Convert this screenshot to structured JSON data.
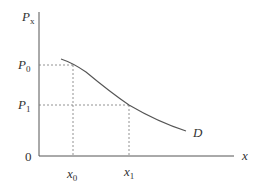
{
  "diagram": {
    "type": "demand-curve",
    "y_axis": {
      "label": "P",
      "label_sub": "x"
    },
    "x_axis": {
      "label": "x"
    },
    "origin_label": "0",
    "price_levels": [
      {
        "label": "P",
        "sub": "0"
      },
      {
        "label": "P",
        "sub": "1"
      }
    ],
    "quantity_levels": [
      {
        "label": "x",
        "sub": "0"
      },
      {
        "label": "x",
        "sub": "1"
      }
    ],
    "curve_label": "D",
    "colors": {
      "axis": "#555555",
      "curve": "#555555",
      "guide": "#777777",
      "text": "#333333"
    }
  }
}
